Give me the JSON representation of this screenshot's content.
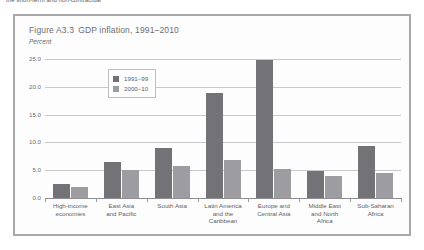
{
  "page": {
    "top_text": "the short-term and non-contractual"
  },
  "figure": {
    "title_number": "Figure A3.3",
    "title_text": "GDP inflation, 1991–2010",
    "subtitle": "Percent"
  },
  "legend": {
    "items": [
      {
        "label": "1991–99",
        "color": "#737377"
      },
      {
        "label": "2000–10",
        "color": "#9d9da1"
      }
    ]
  },
  "chart_data": {
    "type": "bar",
    "subtitle": "Percent",
    "xlabel": "",
    "ylabel": "Percent",
    "ylim": [
      0.0,
      25.0
    ],
    "yticks": [
      "0.0",
      "5.0",
      "10.0",
      "15.0",
      "20.0",
      "25.0"
    ],
    "ytick_values": [
      0.0,
      5.0,
      10.0,
      15.0,
      20.0,
      25.0
    ],
    "grid": true,
    "legend_position": "upper-left-inside",
    "categories": [
      "High-income economies",
      "East Asia and Pacific",
      "South Asia",
      "Latin America and the Caribbean",
      "Europe and Central Asia",
      "Middle East and North Africa",
      "Sub-Saharan Africa"
    ],
    "category_lines": [
      [
        "High-income",
        "economies"
      ],
      [
        "East Asia",
        "and Pacific"
      ],
      [
        "South Asia"
      ],
      [
        "Latin America",
        "and the",
        "Caribbean"
      ],
      [
        "Europe and",
        "Central Asia"
      ],
      [
        "Middle East",
        "and North",
        "Africa"
      ],
      [
        "Sub-Saharan",
        "Africa"
      ]
    ],
    "series": [
      {
        "name": "1991–99",
        "color": "#737377",
        "values": [
          2.6,
          6.4,
          9.0,
          18.8,
          24.8,
          4.8,
          9.4
        ]
      },
      {
        "name": "2000–10",
        "color": "#9d9da1",
        "values": [
          2.0,
          5.0,
          5.8,
          6.9,
          5.3,
          4.0,
          4.5
        ]
      }
    ]
  }
}
